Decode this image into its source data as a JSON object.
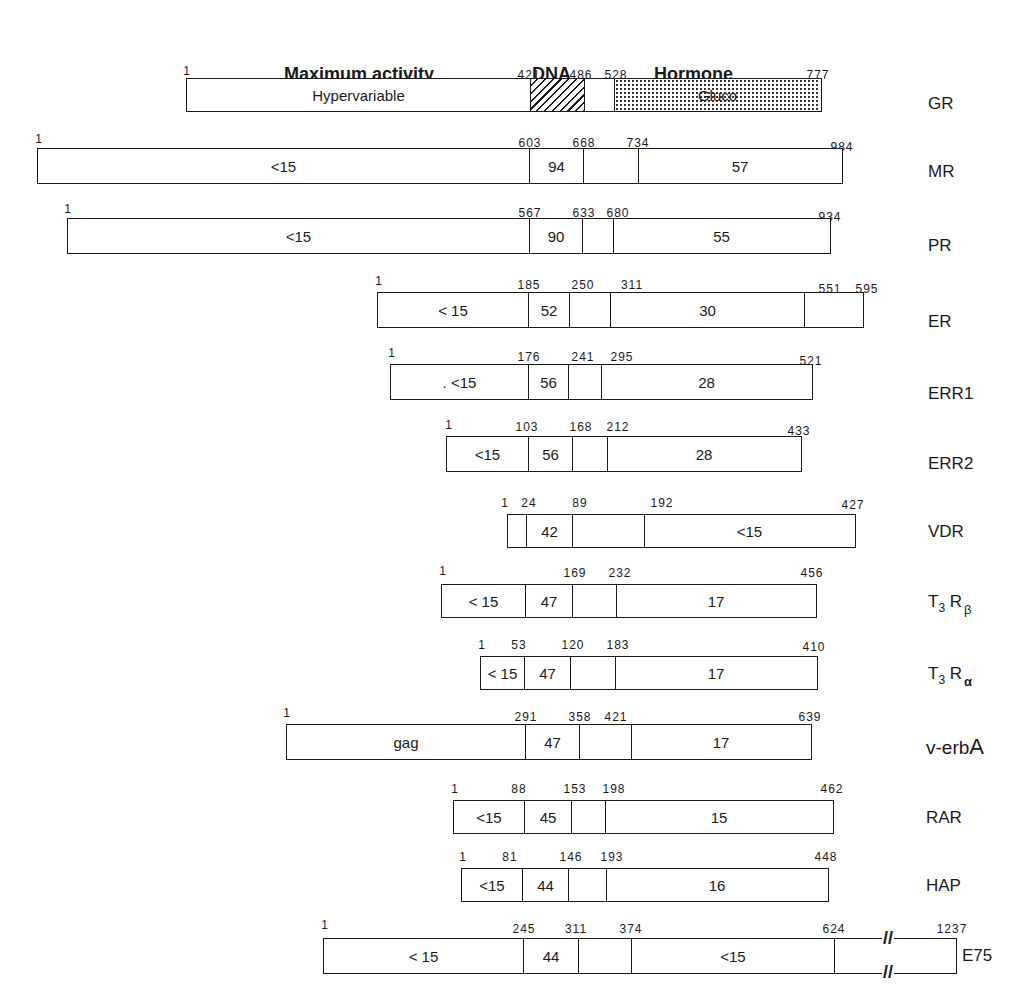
{
  "headers": {
    "maximum_activity": "Maximum activity",
    "dna": "DNA",
    "hormone": "Hormone"
  },
  "receptors": [
    {
      "name": "GR",
      "ticks": [
        "1",
        "421",
        "486",
        "528",
        "777"
      ],
      "labels": [
        "Hypervariable",
        "",
        "",
        "Gluco"
      ]
    },
    {
      "name": "MR",
      "ticks": [
        "1",
        "603",
        "668",
        "734",
        "984"
      ],
      "labels": [
        "<15",
        "94",
        "",
        "57"
      ]
    },
    {
      "name": "PR",
      "ticks": [
        "1",
        "567",
        "633",
        "680",
        "934"
      ],
      "labels": [
        "<15",
        "90",
        "",
        "55"
      ]
    },
    {
      "name": "ER",
      "ticks": [
        "1",
        "185",
        "250",
        "311",
        "551",
        "595"
      ],
      "labels": [
        "< 15",
        "52",
        "",
        "30",
        ""
      ]
    },
    {
      "name": "ERR1",
      "ticks": [
        "1",
        "176",
        "241",
        "295",
        "521"
      ],
      "labels": [
        ". <15",
        "56",
        "",
        "28"
      ]
    },
    {
      "name": "ERR2",
      "ticks": [
        "1",
        "103",
        "168",
        "212",
        "433"
      ],
      "labels": [
        "<15",
        "56",
        "",
        "28"
      ]
    },
    {
      "name": "VDR",
      "ticks": [
        "1",
        "24",
        "89",
        "192",
        "427"
      ],
      "labels": [
        "",
        "42",
        "",
        "<15"
      ]
    },
    {
      "name_main": "T",
      "name_sub": "3",
      "name_main2": "R",
      "name_sub2": "β",
      "ticks": [
        "1",
        "169",
        "232",
        "456"
      ],
      "labels": [
        "< 15",
        "47",
        "",
        "17"
      ]
    },
    {
      "name_main": "T",
      "name_sub": "3",
      "name_main2": "R",
      "name_sub2": "α",
      "ticks": [
        "1",
        "53",
        "120",
        "183",
        "410"
      ],
      "labels": [
        "< 15",
        "47",
        "",
        "17"
      ]
    },
    {
      "name_pre": "v-erb",
      "name_big": "A",
      "ticks": [
        "1",
        "291",
        "358",
        "421",
        "639"
      ],
      "labels": [
        "gag",
        "47",
        "",
        "17"
      ]
    },
    {
      "name": "RAR",
      "ticks": [
        "1",
        "88",
        "153",
        "198",
        "462"
      ],
      "labels": [
        "<15",
        "45",
        "",
        "15"
      ]
    },
    {
      "name": "HAP",
      "ticks": [
        "1",
        "81",
        "146",
        "193",
        "448"
      ],
      "labels": [
        "<15",
        "44",
        "",
        "16"
      ]
    },
    {
      "name": "E75",
      "ticks": [
        "1",
        "245",
        "311",
        "374",
        "624",
        "1237"
      ],
      "labels": [
        "< 15",
        "44",
        "",
        "<15",
        ""
      ],
      "break_mark": "//"
    }
  ]
}
